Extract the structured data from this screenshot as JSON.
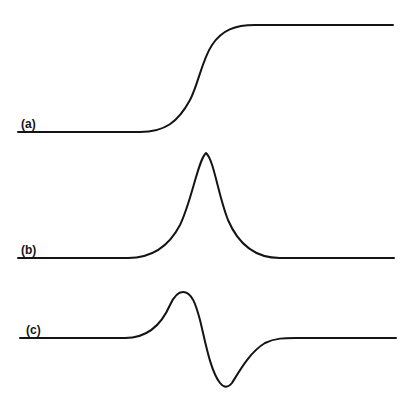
{
  "figure": {
    "panels": [
      {
        "id": "a",
        "label": "(a)",
        "description": "sigmoidal step (integral/absorption edge)"
      },
      {
        "id": "b",
        "label": "(b)",
        "description": "single symmetric peak (absorption line)"
      },
      {
        "id": "c",
        "label": "(c)",
        "description": "first-derivative line shape (positive lobe then negative lobe)"
      }
    ],
    "colors": {
      "line": "#141414",
      "background": "#ffffff"
    }
  }
}
